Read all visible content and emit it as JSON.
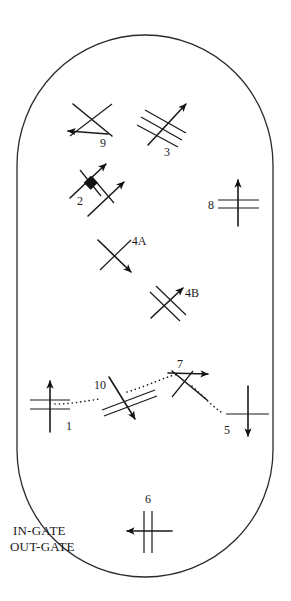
{
  "diagram": {
    "boundary_shape": "stadium-outline",
    "stroke_color": "#2b2b2b",
    "background_color": "#ffffff",
    "gate_labels": {
      "in_gate": "IN-GATE",
      "out_gate": "OUT-GATE"
    },
    "symbols": [
      {
        "id": "9",
        "label": "9",
        "type": "crossing-with-arrow",
        "arrow_direction": "down-left",
        "cross_lines": 1,
        "label_x": 103,
        "label_y": 147
      },
      {
        "id": "3",
        "label": "3",
        "type": "triple-parallel-with-arrow",
        "arrow_direction": "up-right",
        "cross_lines": 3,
        "label_x": 167,
        "label_y": 156
      },
      {
        "id": "2",
        "label": "2",
        "type": "double-arrow-with-diamond",
        "arrow_direction": "up-right",
        "cross_lines": 2,
        "has_diamond_marker": true,
        "label_x": 80,
        "label_y": 205
      },
      {
        "id": "8",
        "label": "8",
        "type": "vertical-arrow-with-crossbars",
        "arrow_direction": "up",
        "cross_lines": 2,
        "label_x": 211,
        "label_y": 209
      },
      {
        "id": "4A",
        "label": "4A",
        "type": "crossing-with-arrow",
        "arrow_direction": "down-right",
        "cross_lines": 1,
        "label_x": 134,
        "label_y": 245
      },
      {
        "id": "4B",
        "label": "4B",
        "type": "double-parallel-with-arrow",
        "arrow_direction": "down-right",
        "cross_lines": 2,
        "label_x": 188,
        "label_y": 297
      },
      {
        "id": "7",
        "label": "7",
        "type": "crossing-with-arrow",
        "arrow_direction": "up-right",
        "cross_lines": 1,
        "label_x": 180,
        "label_y": 368
      },
      {
        "id": "10",
        "label": "10",
        "type": "double-parallel-with-arrow",
        "arrow_direction": "down-right",
        "cross_lines": 2,
        "label_x": 100,
        "label_y": 389
      },
      {
        "id": "1",
        "label": "1",
        "type": "vertical-arrow-with-crossbars",
        "arrow_direction": "up",
        "cross_lines": 2,
        "label_x": 67,
        "label_y": 430
      },
      {
        "id": "5",
        "label": "5",
        "type": "vertical-arrow-with-crossbars",
        "arrow_direction": "down",
        "cross_lines": 1,
        "label_x": 227,
        "label_y": 434
      },
      {
        "id": "6",
        "label": "6",
        "type": "horizontal-arrow-with-crossbars",
        "arrow_direction": "left",
        "cross_lines": 2,
        "label_x": 148,
        "label_y": 501
      }
    ],
    "connection_path": {
      "description": "dotted routing path connecting nodes 1, 10, 7 and 5",
      "sequence": [
        "1",
        "10",
        "7",
        "5"
      ]
    }
  }
}
